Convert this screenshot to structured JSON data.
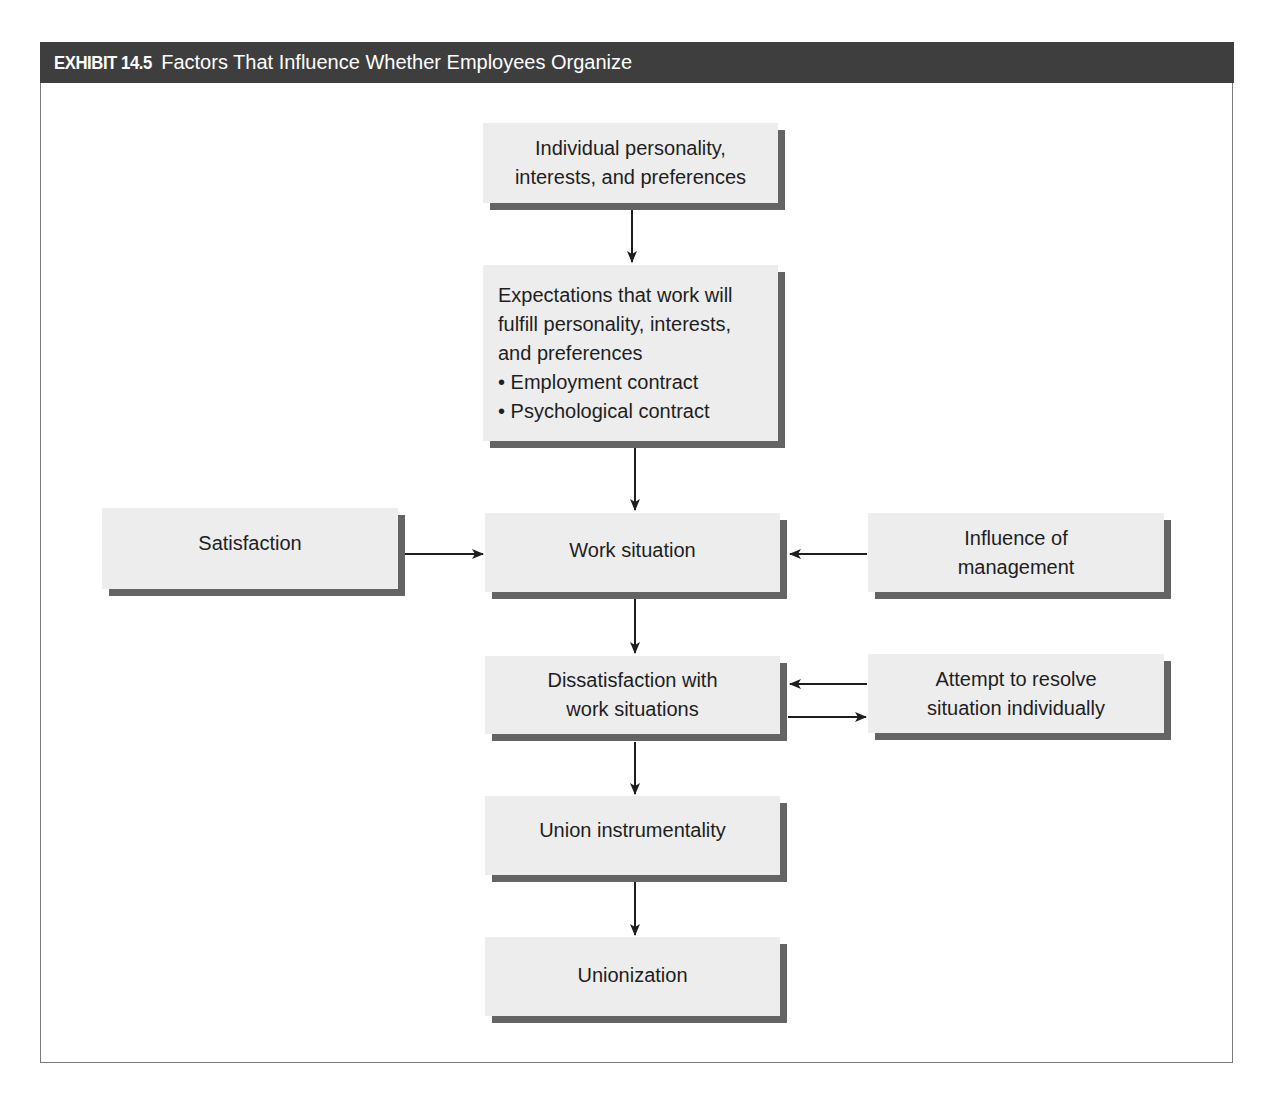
{
  "exhibit": {
    "label": "EXHIBIT 14.5",
    "title": "Factors That Influence Whether Employees Organize",
    "header_color": "#3e3e3e"
  },
  "nodes": {
    "individual": {
      "lines": [
        "Individual personality,",
        "interests, and preferences"
      ]
    },
    "expectations": {
      "lines": [
        "Expectations that work will",
        "fulfill personality, interests,",
        "and preferences"
      ],
      "bullets": [
        "• Employment contract",
        "• Psychological contract"
      ]
    },
    "satisfaction": {
      "lines": [
        "Satisfaction"
      ]
    },
    "work_situation": {
      "lines": [
        "Work situation"
      ]
    },
    "influence": {
      "lines": [
        "Influence of",
        "management"
      ]
    },
    "dissatisfaction": {
      "lines": [
        "Dissatisfaction with",
        "work situations"
      ]
    },
    "attempt": {
      "lines": [
        "Attempt to resolve",
        "situation individually"
      ]
    },
    "union_instrumentality": {
      "lines": [
        "Union instrumentality"
      ]
    },
    "unionization": {
      "lines": [
        "Unionization"
      ]
    }
  },
  "edges": [
    {
      "from": "individual",
      "to": "expectations"
    },
    {
      "from": "expectations",
      "to": "work_situation"
    },
    {
      "from": "satisfaction",
      "to": "work_situation"
    },
    {
      "from": "influence",
      "to": "work_situation"
    },
    {
      "from": "work_situation",
      "to": "dissatisfaction"
    },
    {
      "from": "attempt",
      "to": "dissatisfaction"
    },
    {
      "from": "dissatisfaction",
      "to": "attempt"
    },
    {
      "from": "dissatisfaction",
      "to": "union_instrumentality"
    },
    {
      "from": "union_instrumentality",
      "to": "unionization"
    }
  ]
}
